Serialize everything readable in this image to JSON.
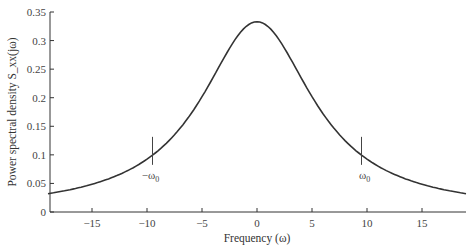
{
  "chart_data": {
    "type": "line",
    "title": "",
    "xlabel": "Frequency (ω)",
    "ylabel": "Power spectral density S_xx(jω)",
    "xlim": [
      -19,
      19
    ],
    "ylim": [
      0,
      0.35
    ],
    "x_ticks": [
      -15,
      -10,
      -5,
      0,
      5,
      10,
      15
    ],
    "y_ticks": [
      0,
      0.05,
      0.1,
      0.15,
      0.2,
      0.25,
      0.3,
      0.35
    ],
    "y_tick_labels": [
      "0",
      "0.05",
      "0.1",
      "0.15",
      "0.2",
      "0.25",
      "0.3",
      "0.35"
    ],
    "grid": false,
    "legend": null,
    "series": [
      {
        "name": "S_xx(jω)",
        "x": [
          -19,
          -15,
          -10,
          -9.5,
          -5,
          0,
          5,
          9.5,
          10,
          15,
          19
        ],
        "values": [
          0.032,
          0.049,
          0.093,
          0.1,
          0.2,
          0.333,
          0.2,
          0.1,
          0.093,
          0.049,
          0.032
        ]
      }
    ],
    "annotations": [
      {
        "text": "−ω0",
        "x": -9.5,
        "y": 0.1
      },
      {
        "text": "ω0",
        "x": 9.5,
        "y": 0.1
      }
    ]
  }
}
